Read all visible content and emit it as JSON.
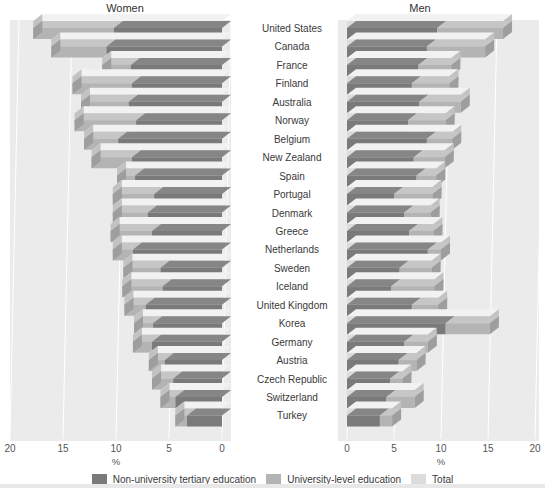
{
  "panels": {
    "women": {
      "title": "Women"
    },
    "men": {
      "title": "Men"
    }
  },
  "axis": {
    "unit": "%",
    "women_ticks": [
      "20",
      "15",
      "10",
      "5",
      "0"
    ],
    "men_ticks": [
      "0",
      "5",
      "10",
      "15",
      "20"
    ],
    "max": 20
  },
  "legend": [
    {
      "label": "Non-university tertiary education",
      "color": "#7a7a7a"
    },
    {
      "label": "University-level education",
      "color": "#b4b4b4"
    },
    {
      "label": "Total",
      "color": "#dcdcdc"
    }
  ],
  "colors": {
    "non_university": "#7a7a7a",
    "university": "#b4b4b4",
    "total": "#dcdcdc",
    "panel_bg": "#ebebeb",
    "grid": "#ffffff",
    "text": "#3a3a3a"
  },
  "chart_data": {
    "type": "bar",
    "orientation": "horizontal",
    "layout": "back-to-back population pyramid, 3-D stacked bars",
    "title": "",
    "xlabel": "%",
    "ylabel": "",
    "xlim": [
      0,
      20
    ],
    "grid": true,
    "legend_position": "bottom",
    "categories": [
      "United States",
      "Canada",
      "France",
      "Finland",
      "Australia",
      "Norway",
      "Belgium",
      "New Zealand",
      "Spain",
      "Portugal",
      "Denmark",
      "Greece",
      "Netherlands",
      "Sweden",
      "Iceland",
      "United Kingdom",
      "Korea",
      "Germany",
      "Austria",
      "Czech Republic",
      "Switzerland",
      "Turkey"
    ],
    "series": [
      {
        "name": "Women - Non-university tertiary education",
        "panel": "women",
        "color": "#7a7a7a",
        "values": [
          10.2,
          10.9,
          8.6,
          8.5,
          8.8,
          8.1,
          9.8,
          8.5,
          8.2,
          6.4,
          7.0,
          6.6,
          8.4,
          5.8,
          5.6,
          7.2,
          6.5,
          6.6,
          5.4,
          4.6,
          4.4,
          3.3
        ]
      },
      {
        "name": "Women - University-level education",
        "panel": "women",
        "color": "#b4b4b4",
        "values": [
          7.6,
          5.2,
          2.7,
          5.6,
          4.5,
          5.8,
          3.2,
          3.8,
          1.7,
          3.9,
          3.3,
          3.9,
          1.9,
          3.5,
          3.8,
          2.0,
          1.8,
          1.8,
          1.5,
          2.0,
          1.4,
          1.1
        ]
      },
      {
        "name": "Women - Total",
        "panel": "women",
        "color": "#dcdcdc",
        "values": [
          17.8,
          16.1,
          11.3,
          14.1,
          13.3,
          13.9,
          13.0,
          12.3,
          9.9,
          10.3,
          10.3,
          10.5,
          10.3,
          9.3,
          9.4,
          9.2,
          8.3,
          8.4,
          6.9,
          6.6,
          5.8,
          4.4
        ]
      },
      {
        "name": "Men - Non-university tertiary education",
        "panel": "men",
        "color": "#7a7a7a",
        "values": [
          9.6,
          8.5,
          7.6,
          6.9,
          7.7,
          6.5,
          8.5,
          7.1,
          7.4,
          5.0,
          6.1,
          6.6,
          8.6,
          5.6,
          4.7,
          6.9,
          10.5,
          6.1,
          5.5,
          4.6,
          4.2,
          3.5
        ]
      },
      {
        "name": "Men - University-level education",
        "panel": "men",
        "color": "#b4b4b4",
        "values": [
          7.0,
          6.2,
          3.5,
          4.0,
          4.4,
          4.0,
          2.7,
          3.3,
          2.1,
          4.1,
          2.8,
          2.6,
          1.4,
          3.4,
          4.6,
          2.8,
          4.7,
          2.5,
          1.9,
          1.3,
          3.0,
          1.3
        ]
      },
      {
        "name": "Men - Total",
        "panel": "men",
        "color": "#dcdcdc",
        "values": [
          16.6,
          14.7,
          11.1,
          10.9,
          12.1,
          10.5,
          11.2,
          10.4,
          9.5,
          9.1,
          8.9,
          9.2,
          10.0,
          9.0,
          9.3,
          9.7,
          15.2,
          8.6,
          7.4,
          5.9,
          7.2,
          4.8
        ]
      }
    ]
  }
}
